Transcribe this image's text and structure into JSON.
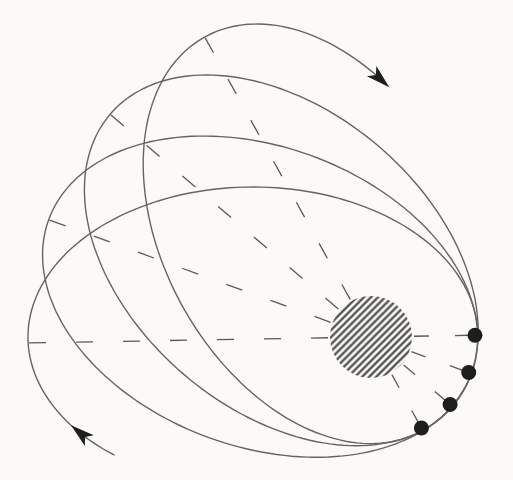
{
  "figure": {
    "type": "orbital-precession-diagram",
    "canvas": {
      "width": 513,
      "height": 480
    },
    "colors": {
      "background": "#fbfaf7",
      "curve": "#646464",
      "axis": "#595959",
      "ink": "#1e1e1e",
      "hatch": "#3e3e3e"
    },
    "central_body": {
      "cx": 371,
      "cy": 337,
      "radius": 41,
      "hatch_spacing": 5,
      "hatch_angle_deg": 45,
      "hatch_stroke_width": 2.1
    },
    "orbit_shape": {
      "semi_major": 225,
      "semi_minor": 150,
      "center_offset_from_body": 118
    },
    "orbits": [
      {
        "rotation_deg": 0,
        "t_start": 128,
        "t_end": 360,
        "closed": false
      },
      {
        "rotation_deg": 20,
        "t_start": 0,
        "t_end": 360,
        "closed": true
      },
      {
        "rotation_deg": 40.5,
        "t_start": 0,
        "t_end": 360,
        "closed": true
      },
      {
        "rotation_deg": 61,
        "t_start": 335,
        "t_end": 606,
        "closed": false
      }
    ],
    "axes": {
      "angles_deg": [
        -1,
        20,
        40.5,
        61
      ],
      "perihelion_side": {
        "r_inner": 43,
        "r_outer": 104,
        "dash": "15 26"
      },
      "aphelion_side": {
        "r_inner": 43,
        "r_outer": 343,
        "dash": "17 30"
      }
    },
    "perihelion_dots": {
      "radius": 7.5,
      "distance": 104,
      "angles_deg": [
        -1,
        20,
        40.5,
        61
      ]
    },
    "arrows": [
      {
        "name": "direction-arrow-top",
        "orbit_index": 3,
        "t_deg": 606,
        "length": 24,
        "half_width": 7
      },
      {
        "name": "direction-arrow-bottom",
        "orbit_index": 0,
        "t_deg": 144,
        "length": 24,
        "half_width": 7
      }
    ],
    "stroke_widths": {
      "curve": 1.4,
      "axis": 1.3
    }
  }
}
